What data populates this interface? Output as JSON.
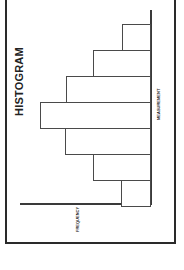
{
  "chart_data": {
    "type": "bar",
    "title": "HISTOGRAM",
    "xlabel": "MEASUREMENT",
    "ylabel": "FREQUENCY",
    "orientation_note": "image rotated 90 degrees counterclockwise",
    "categories": [
      "1",
      "2",
      "3",
      "4",
      "5",
      "6",
      "7"
    ],
    "values": [
      30,
      58,
      86,
      111,
      85,
      58,
      29
    ],
    "ylim": [
      0,
      130
    ],
    "grid": false,
    "tick_labels_shown": false
  },
  "layout": {
    "baseline_x": 151,
    "bar_top_y": 24,
    "bar_width": 26,
    "bar_count": 7
  }
}
